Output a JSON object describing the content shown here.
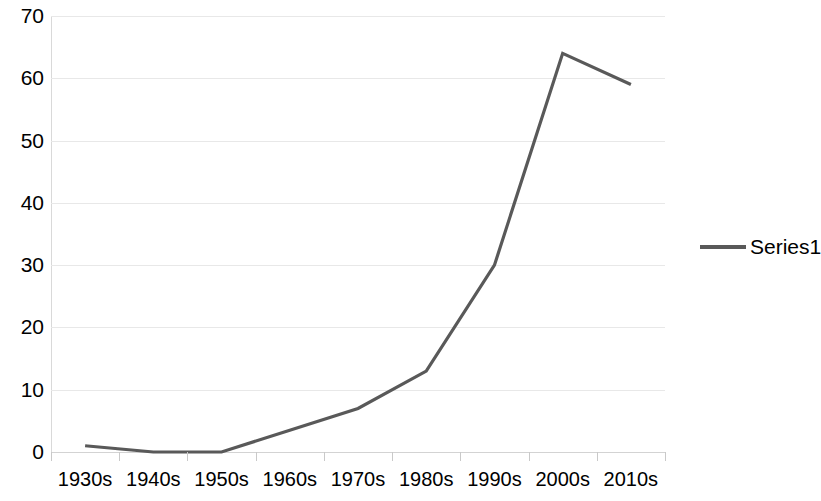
{
  "chart_data": {
    "type": "line",
    "title": "",
    "subtitle": "",
    "xlabel": "",
    "ylabel": "",
    "categories": [
      "1930s",
      "1940s",
      "1950s",
      "1960s",
      "1970s",
      "1980s",
      "1990s",
      "2000s",
      "2010s"
    ],
    "series": [
      {
        "name": "Series1",
        "values": [
          1,
          0,
          0,
          3.5,
          7,
          13,
          30,
          64,
          59
        ],
        "color": "#595959"
      }
    ],
    "ylim": [
      0,
      70
    ],
    "yticks": [
      0,
      10,
      20,
      30,
      40,
      50,
      60,
      70
    ],
    "ytick_labels": [
      "0",
      "10",
      "20",
      "30",
      "40",
      "50",
      "60",
      "70"
    ],
    "xlim_categories": 9,
    "grid": {
      "horizontal": true,
      "vertical": false,
      "color": "#e8e8e8"
    },
    "legend": {
      "position": "right",
      "entries": [
        {
          "label": "Series1",
          "marker": "line-swatch",
          "color": "#595959"
        }
      ]
    },
    "background_color": "#ffffff",
    "axis_color": "#d9d9d9"
  }
}
